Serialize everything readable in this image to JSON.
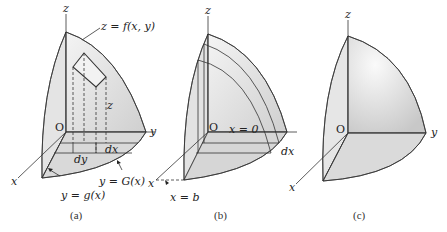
{
  "panels": [
    {
      "id": "a",
      "caption": "(a)",
      "labels": {
        "z_axis": "z",
        "x_axis": "x",
        "y_axis": "y",
        "origin": "O",
        "surface": "z = f(x, y)",
        "height": "z",
        "dx": "dx",
        "dy": "dy",
        "lower_curve": "y = g(x)",
        "upper_curve": "y = G(x)"
      }
    },
    {
      "id": "b",
      "caption": "(b)",
      "labels": {
        "z_axis": "z",
        "x_axis": "x",
        "y_axis": "y",
        "origin": "O",
        "plane": "x = 0",
        "dx": "dx",
        "bound": "x = b"
      }
    },
    {
      "id": "c",
      "caption": "(c)",
      "labels": {
        "z_axis": "z",
        "x_axis": "x",
        "y_axis": "y",
        "origin": "O"
      }
    }
  ],
  "colors": {
    "fill_light": "#ededed",
    "fill_mid": "#d6d6d6",
    "line": "#333333"
  }
}
